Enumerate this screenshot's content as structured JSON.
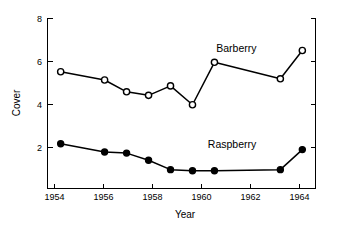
{
  "chart_data": {
    "type": "line",
    "title": "",
    "xlabel": "Year",
    "ylabel": "Cover",
    "xlim": [
      1953.4,
      1965.6
    ],
    "ylim": [
      0.75,
      8.0
    ],
    "grid": false,
    "legend_position": "inline-annotations",
    "xticks": [
      1954,
      1956,
      1958,
      1960,
      1962,
      1964
    ],
    "xtick_labels": [
      "1954",
      "1956",
      "1958",
      "1960",
      "1962",
      "1964"
    ],
    "yticks": [
      2,
      4,
      6,
      8
    ],
    "ytick_labels": [
      "2",
      "4",
      "6",
      "8"
    ],
    "series": [
      {
        "name": "Barberry",
        "marker": "open-circle",
        "x": [
          1954,
          1956,
          1957,
          1958,
          1959,
          1960,
          1961,
          1964,
          1965
        ],
        "values": [
          5.7,
          5.35,
          4.85,
          4.7,
          5.1,
          4.3,
          6.1,
          5.4,
          6.6
        ],
        "label": "Barberry"
      },
      {
        "name": "Raspberry",
        "marker": "filled-circle",
        "x": [
          1954,
          1956,
          1957,
          1958,
          1959,
          1960,
          1961,
          1964,
          1965
        ],
        "values": [
          2.65,
          2.3,
          2.25,
          1.95,
          1.55,
          1.5,
          1.5,
          1.55,
          2.4
        ],
        "label": "Raspberry"
      }
    ],
    "annotations": [
      {
        "text": "Barberry",
        "x": 1962.0,
        "y": 6.55
      },
      {
        "text": "Raspberry",
        "x": 1961.8,
        "y": 2.45
      }
    ]
  },
  "axis": {
    "y_title": "Cover",
    "x_title": "Year"
  },
  "ticks": {
    "y": [
      "8",
      "6",
      "4",
      "2"
    ],
    "x": [
      "1954",
      "1956",
      "1958",
      "1960",
      "1962",
      "1964"
    ]
  },
  "labels": {
    "barberry": "Barberry",
    "raspberry": "Raspberry"
  }
}
